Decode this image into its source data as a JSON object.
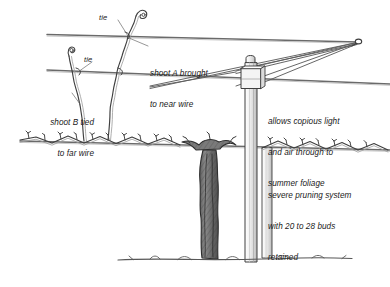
{
  "figure": {
    "background_color": "#ffffff",
    "ink_color": "#3f3f3f",
    "text_color": "#1a1a1a",
    "width": 390,
    "height": 287
  },
  "annotations": {
    "tie_upper": "tie",
    "tie_lower": "tie",
    "shoot_a": "shoot A brought\nto near wire",
    "shoot_a_line1": "shoot A brought",
    "shoot_a_line2": "to near wire",
    "shoot_b": "shoot B tied\nto far wire",
    "shoot_b_line1": "shoot B tied",
    "shoot_b_line2": "to far wire",
    "light_air_line1": "allows copious light",
    "light_air_line2": "and air through to",
    "light_air_line3": "summer foliage",
    "pruning_line1": "severe pruning system",
    "pruning_line2": "with 20 to 28 buds",
    "pruning_line3": "retained"
  },
  "parts": {
    "post": "trellis post",
    "cross_arm": "cross arm",
    "top_wire": "top wire",
    "middle_wire": "middle wire",
    "cordon_wire": "cordon wire",
    "trunk": "vine trunk",
    "cordon_left": "left cordon cane",
    "cordon_right": "right cordon cane",
    "shoot_a_stem": "shoot A",
    "shoot_b_stem": "shoot B",
    "ground": "ground line"
  }
}
